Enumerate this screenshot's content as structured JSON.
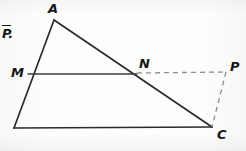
{
  "figure": {
    "kind": "geometry-diagram",
    "background_color": "#fdfdfc",
    "stroke_color": "#2b2b2f",
    "dashed_color": "#8a8a90",
    "solid_stroke_width": 1.6,
    "dashed_stroke_width": 1.3,
    "dash_pattern": "5,4",
    "labels": [
      {
        "id": "label-p-bar",
        "text": "P",
        "overline": true,
        "trailing": ".",
        "x": 2,
        "y": 25
      },
      {
        "id": "label-a",
        "text": "A",
        "x": 48,
        "y": 2
      },
      {
        "id": "label-m",
        "text": "M",
        "x": 11,
        "y": 66
      },
      {
        "id": "label-n",
        "text": "N",
        "x": 139,
        "y": 57
      },
      {
        "id": "label-p",
        "text": "P",
        "x": 230,
        "y": 60
      },
      {
        "id": "label-c",
        "text": "C",
        "x": 217,
        "y": 128
      }
    ],
    "points": {
      "A": {
        "x": 54,
        "y": 20
      },
      "B": {
        "x": 14,
        "y": 128
      },
      "C": {
        "x": 212,
        "y": 127
      },
      "M": {
        "x": 28,
        "y": 74
      },
      "N": {
        "x": 137,
        "y": 74
      },
      "P": {
        "x": 226,
        "y": 73
      }
    },
    "segments": [
      {
        "id": "segment-AB",
        "from": "A",
        "to": "B",
        "style": "solid"
      },
      {
        "id": "segment-AC",
        "from": "A",
        "to": "C",
        "style": "solid"
      },
      {
        "id": "segment-BC",
        "from": "B",
        "to": "C",
        "style": "solid"
      },
      {
        "id": "segment-MN",
        "from": "M",
        "to": "N",
        "style": "solid"
      },
      {
        "id": "segment-NP",
        "from": "N",
        "to": "P",
        "style": "dashed"
      },
      {
        "id": "segment-PC",
        "from": "P",
        "to": "C",
        "style": "dashed"
      }
    ]
  }
}
